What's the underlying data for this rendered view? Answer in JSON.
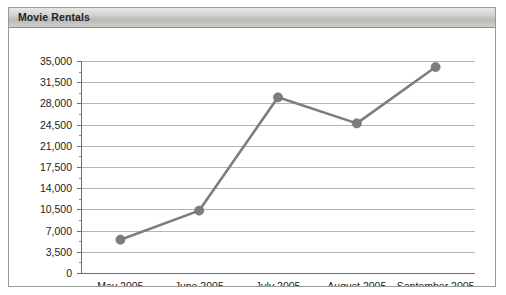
{
  "panel": {
    "title": "Movie Rentals"
  },
  "chart_data": {
    "type": "line",
    "title": "Movie Rentals",
    "xlabel": "",
    "ylabel": "",
    "categories": [
      "May 2005",
      "June 2005",
      "July 2005",
      "August 2005",
      "September 2005"
    ],
    "values": [
      5500,
      10300,
      29000,
      24700,
      34000
    ],
    "series": [
      {
        "name": "Movie Rentals",
        "values": [
          5500,
          10300,
          29000,
          24700,
          34000
        ]
      }
    ],
    "ylim": [
      0,
      35000
    ],
    "ytick_labels": [
      "0",
      "3,500",
      "7,000",
      "10,500",
      "14,000",
      "17,500",
      "21,000",
      "24,500",
      "28,000",
      "31,500",
      "35,000"
    ],
    "ytick_values": [
      0,
      3500,
      7000,
      10500,
      14000,
      17500,
      21000,
      24500,
      28000,
      31500,
      35000
    ],
    "grid": true,
    "legend": "none",
    "line_color": "#7d7d7d",
    "marker_color": "#7d7d7d",
    "gridline_color": "#b5b5b5",
    "axis_color": "#6e6e6e",
    "plot_background": "#ffffff"
  }
}
